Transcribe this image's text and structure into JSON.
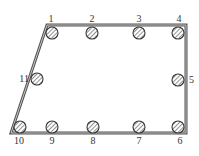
{
  "diagram": {
    "type": "reinforced-section",
    "colors": {
      "outline": "#555555",
      "hatch": "#444444",
      "circle_fill": "#ffffff"
    },
    "outline": [
      [
        47,
        25
      ],
      [
        186,
        25
      ],
      [
        186,
        133
      ],
      [
        11,
        133
      ]
    ],
    "bars": [
      {
        "id": "1",
        "label": "1",
        "cx": 52,
        "cy": 33,
        "lx": 51,
        "ly": 22,
        "anchor": "middle"
      },
      {
        "id": "2",
        "label": "2",
        "cx": 92,
        "cy": 33,
        "lx": 92,
        "ly": 22,
        "anchor": "middle"
      },
      {
        "id": "3",
        "label": "3",
        "cx": 139,
        "cy": 33,
        "lx": 139,
        "ly": 22,
        "anchor": "middle"
      },
      {
        "id": "4",
        "label": "4",
        "cx": 178,
        "cy": 33,
        "lx": 179,
        "ly": 22,
        "anchor": "middle"
      },
      {
        "id": "5",
        "label": "5",
        "cx": 178,
        "cy": 80,
        "lx": 189,
        "ly": 83,
        "anchor": "start"
      },
      {
        "id": "6",
        "label": "6",
        "cx": 178,
        "cy": 127,
        "lx": 180,
        "ly": 144,
        "anchor": "middle"
      },
      {
        "id": "7",
        "label": "7",
        "cx": 139,
        "cy": 127,
        "lx": 139,
        "ly": 144,
        "anchor": "middle"
      },
      {
        "id": "8",
        "label": "8",
        "cx": 93,
        "cy": 127,
        "lx": 93,
        "ly": 144,
        "anchor": "middle"
      },
      {
        "id": "9",
        "label": "9",
        "cx": 52,
        "cy": 127,
        "lx": 52,
        "ly": 144,
        "anchor": "middle"
      },
      {
        "id": "10",
        "label": "10",
        "cx": 20,
        "cy": 127,
        "lx": 19,
        "ly": 144,
        "anchor": "middle"
      },
      {
        "id": "11",
        "label": "11",
        "cx": 37,
        "cy": 79,
        "lx": 29,
        "ly": 82,
        "anchor": "end"
      }
    ],
    "bar_radius": 6
  }
}
